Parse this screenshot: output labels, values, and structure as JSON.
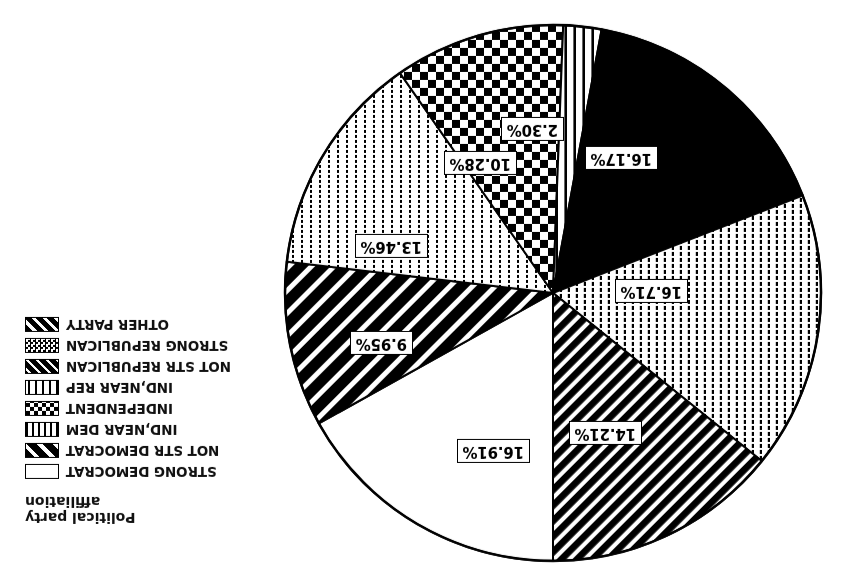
{
  "legend": {
    "title_line1": "Political party",
    "title_line2": "affiliation",
    "items": [
      {
        "label": "STRONG DEMOCRAT",
        "pattern": "plain-white"
      },
      {
        "label": "NOT STR DEMOCRAT",
        "pattern": "wide-diagonal-stripes"
      },
      {
        "label": "IND,NEAR DEM",
        "pattern": "fine-dotted"
      },
      {
        "label": "INDEPENDENT",
        "pattern": "checkerboard"
      },
      {
        "label": "IND,NEAR REP",
        "pattern": "vertical-bars"
      },
      {
        "label": "NOT STR REPUBLICAN",
        "pattern": "crosshatch"
      },
      {
        "label": "STRONG REPUBLICAN",
        "pattern": "small-checker-light"
      },
      {
        "label": "OTHER PARTY",
        "pattern": "narrow-diagonal-stripes"
      }
    ]
  },
  "chart_data": {
    "type": "pie",
    "title": "Political party affiliation",
    "categories": [
      "STRONG DEMOCRAT",
      "NOT STR DEMOCRAT",
      "IND,NEAR DEM",
      "INDEPENDENT",
      "IND,NEAR REP",
      "NOT STR REPUBLICAN",
      "STRONG REPUBLICAN",
      "OTHER PARTY"
    ],
    "values": [
      16.91,
      9.95,
      13.46,
      10.28,
      2.3,
      16.17,
      16.71,
      14.21
    ],
    "labels": [
      "16.91%",
      "9.95%",
      "13.46%",
      "10.28%",
      "2.30%",
      "16.17%",
      "16.71%",
      "14.21%"
    ],
    "unit": "percent",
    "legend_position": "left",
    "grid": false,
    "rotated_180": true,
    "colors": {
      "fill": "#000000",
      "background": "#ffffff",
      "outline": "#000000"
    }
  },
  "slice_labels": {
    "s0": "16.91%",
    "s1": "9.95%",
    "s2": "13.46%",
    "s3": "10.28%",
    "s4": "2.30%",
    "s5": "16.17%",
    "s6": "16.71%",
    "s7": "14.21%"
  }
}
